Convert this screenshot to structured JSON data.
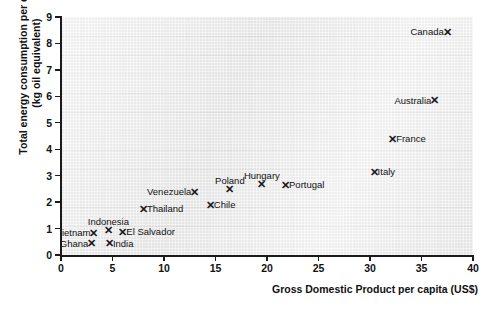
{
  "chart_data": {
    "type": "scatter",
    "title": "",
    "xlabel": "Gross Domestic Product per capita (US$)",
    "ylabel": "Total energy consumption per capita (kg oil equivalent)",
    "xlim": [
      0,
      40
    ],
    "ylim": [
      0,
      9
    ],
    "xticks": [
      "0",
      "5",
      "10",
      "15",
      "20",
      "25",
      "30",
      "35",
      "40"
    ],
    "yticks": [
      "0",
      "1",
      "2",
      "3",
      "4",
      "5",
      "6",
      "7",
      "8",
      "9"
    ],
    "grid": true,
    "legend": "none",
    "marker": "x-cross",
    "marker_glyph": "✕",
    "points": [
      {
        "label": "Canada",
        "x": 37.5,
        "y": 8.45,
        "label_pos": "left"
      },
      {
        "label": "Australia",
        "x": 36.3,
        "y": 5.85,
        "label_pos": "left"
      },
      {
        "label": "France",
        "x": 32.2,
        "y": 4.4,
        "label_pos": "right"
      },
      {
        "label": "Italy",
        "x": 30.4,
        "y": 3.15,
        "label_pos": "right"
      },
      {
        "label": "Portugal",
        "x": 21.8,
        "y": 2.65,
        "label_pos": "right"
      },
      {
        "label": "Hungary",
        "x": 19.5,
        "y": 2.7,
        "label_pos": "above"
      },
      {
        "label": "Poland",
        "x": 16.4,
        "y": 2.5,
        "label_pos": "above"
      },
      {
        "label": "Venezuela",
        "x": 13.0,
        "y": 2.4,
        "label_pos": "left"
      },
      {
        "label": "Chile",
        "x": 14.5,
        "y": 1.9,
        "label_pos": "right"
      },
      {
        "label": "Thailand",
        "x": 8.0,
        "y": 1.75,
        "label_pos": "right"
      },
      {
        "label": "Indonesia",
        "x": 4.6,
        "y": 0.95,
        "label_pos": "above"
      },
      {
        "label": "El Salvador",
        "x": 6.0,
        "y": 0.88,
        "label_pos": "right"
      },
      {
        "label": "Vietnam",
        "x": 3.2,
        "y": 0.85,
        "label_pos": "left"
      },
      {
        "label": "India",
        "x": 4.7,
        "y": 0.45,
        "label_pos": "right"
      },
      {
        "label": "Ghana",
        "x": 3.0,
        "y": 0.45,
        "label_pos": "left"
      }
    ]
  },
  "colors": {
    "plot_background": "#e8e8e8",
    "axis": "#1a1a1a",
    "marker": "#1a1a1a",
    "text": "#111111",
    "page_background": "#ffffff"
  }
}
